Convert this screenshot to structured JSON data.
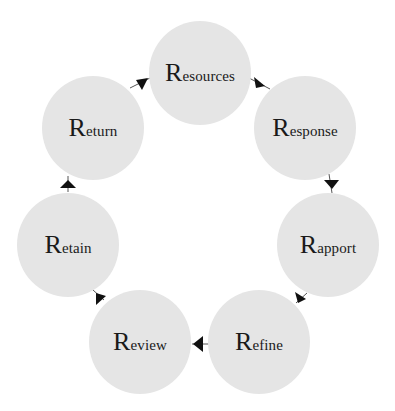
{
  "diagram": {
    "type": "cycle",
    "direction": "clockwise",
    "node_color": "#e5e5e5",
    "arrow_color": "#111111",
    "nodes": [
      {
        "id": "resources",
        "cap": "R",
        "rest": "esources",
        "label": "Resources",
        "cx": 200,
        "cy": 73
      },
      {
        "id": "response",
        "cap": "R",
        "rest": "esponse",
        "label": "Response",
        "cx": 305,
        "cy": 128
      },
      {
        "id": "rapport",
        "cap": "R",
        "rest": "apport",
        "label": "Rapport",
        "cx": 328,
        "cy": 245
      },
      {
        "id": "refine",
        "cap": "R",
        "rest": "efine",
        "label": "Refine",
        "cx": 259,
        "cy": 342
      },
      {
        "id": "review",
        "cap": "R",
        "rest": "eview",
        "label": "Review",
        "cx": 140,
        "cy": 342
      },
      {
        "id": "retain",
        "cap": "R",
        "rest": "etain",
        "label": "Retain",
        "cx": 68,
        "cy": 245
      },
      {
        "id": "return",
        "cap": "R",
        "rest": "eturn",
        "label": "Return",
        "cx": 93,
        "cy": 128
      }
    ],
    "edges": [
      {
        "from": "resources",
        "to": "response"
      },
      {
        "from": "response",
        "to": "rapport"
      },
      {
        "from": "rapport",
        "to": "refine"
      },
      {
        "from": "refine",
        "to": "review"
      },
      {
        "from": "review",
        "to": "retain"
      },
      {
        "from": "retain",
        "to": "return"
      },
      {
        "from": "return",
        "to": "resources"
      }
    ]
  }
}
